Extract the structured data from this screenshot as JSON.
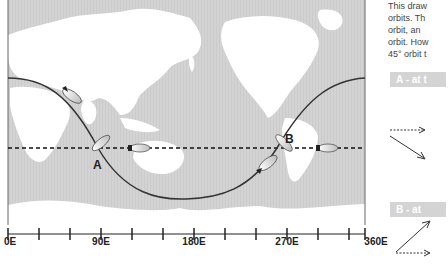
{
  "diagram": {
    "description_lines": [
      "This draw",
      "orbits. Th",
      "orbit,  an",
      "orbit. How",
      "45° orbit t"
    ],
    "tags": {
      "a": "A - at t",
      "b": "B - at"
    },
    "points": {
      "a": "A",
      "b": "B"
    },
    "x_axis": {
      "ticks": [
        0,
        45,
        90,
        135,
        180,
        225,
        270,
        315,
        360
      ],
      "labels": [
        {
          "value": 0,
          "text": "0E"
        },
        {
          "value": 90,
          "text": "90E"
        },
        {
          "value": 180,
          "text": "180E"
        },
        {
          "value": 270,
          "text": "270E"
        },
        {
          "value": 360,
          "text": "360E"
        }
      ]
    },
    "orbits": {
      "equatorial": {
        "style": "dashed",
        "color": "#111111"
      },
      "inclined_45": {
        "style": "solid",
        "color": "#333333"
      }
    },
    "colors": {
      "ocean": "#d3d3d3",
      "land": "#ffffff",
      "frame": "#555555"
    }
  }
}
